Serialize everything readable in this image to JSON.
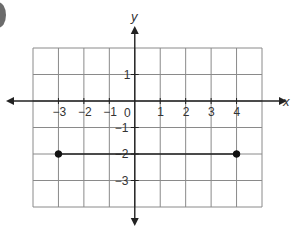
{
  "chart_data": {
    "type": "coordinate-plane",
    "title": "",
    "xlabel": "x",
    "ylabel": "y",
    "xlim": [
      -4,
      5
    ],
    "ylim": [
      -4,
      2
    ],
    "grid": true,
    "x_ticks": [
      {
        "value": -3,
        "label": "−3"
      },
      {
        "value": -2,
        "label": "−2"
      },
      {
        "value": -1,
        "label": "−1"
      },
      {
        "value": 1,
        "label": "1"
      },
      {
        "value": 2,
        "label": "2"
      },
      {
        "value": 3,
        "label": "3"
      },
      {
        "value": 4,
        "label": "4"
      }
    ],
    "y_ticks": [
      {
        "value": 1,
        "label": "1"
      },
      {
        "value": -1,
        "label": "−1"
      },
      {
        "value": -2,
        "label": "−2"
      },
      {
        "value": -3,
        "label": "−3"
      }
    ],
    "origin_label": "0",
    "points": [
      {
        "x": -3,
        "y": -2,
        "style": "closed"
      },
      {
        "x": 4,
        "y": -2,
        "style": "closed"
      }
    ],
    "segments": [
      {
        "from": {
          "x": -3,
          "y": -2
        },
        "to": {
          "x": 4,
          "y": -2
        }
      }
    ],
    "colors": {
      "grid": "#8a8a8a",
      "axis": "#222222",
      "point": "#111111",
      "text": "#333333"
    }
  }
}
